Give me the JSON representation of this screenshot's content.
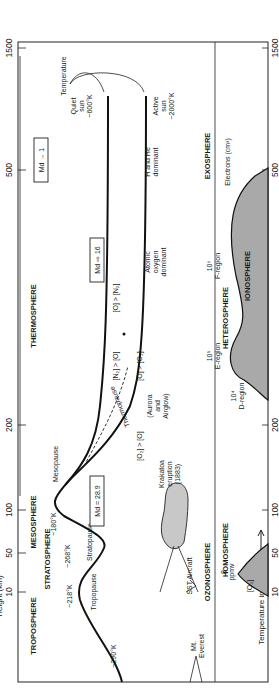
{
  "diagram": {
    "type": "atmospheric-structure",
    "orientation": "rotated-90-ccw",
    "y_axis": {
      "label": "Height (km)",
      "ticks": [
        "1500",
        "500",
        "200",
        "100",
        "50",
        "10"
      ]
    },
    "x_axis": {
      "label": "Temperature increase",
      "arrow": "→"
    },
    "thermal_layers": [
      {
        "name": "THERMOSPHERE"
      },
      {
        "name": "MESOSPHERE"
      },
      {
        "name": "STRATOSPHERE"
      },
      {
        "name": "TROPOSPHERE"
      }
    ],
    "temperature_labels": {
      "temperature": "Temperature",
      "quiet_sun": [
        "Quiet",
        "sun",
        "~600°K"
      ],
      "active_sun": [
        "Active",
        "sun",
        "~2000°K"
      ],
      "thermopause": "Thermopause",
      "mesopause": "Mesopause",
      "mesopause_temp": "~180°K",
      "stratopause": "Stratopause",
      "stratopause_temp": "~268°K",
      "tropopause": "Tropopause",
      "tropopause_temp": "~218°K",
      "surface_temp": "~290°K"
    },
    "composition": {
      "h_he": [
        "H and He",
        "dominant"
      ],
      "atomic_oxygen": [
        "Atomic",
        "oxygen",
        "dominant"
      ],
      "o_gt_o2": "[O] > [O₂]",
      "o2_gt_o": "[O₂] > [O]",
      "aurora": [
        "(Aurora",
        "and",
        "Airglow)"
      ],
      "o_gt_n2": "[O] > [N₂]",
      "n2_gt_o": "[N₂] > [O]"
    },
    "molecular_weight": {
      "md_1": "Md → 1",
      "md_16": "Md ⇨ 16",
      "md_28": "Md = 28.9"
    },
    "spheres": {
      "exosphere": "EXOSPHERE",
      "heterosphere": "HETEROSPHERE",
      "homosphere": "HOMOSPHERE",
      "ionosphere": "IONOSPHERE",
      "ozonosphere": "OZONOSPHERE"
    },
    "ionosphere_regions": {
      "electrons": "Electrons (cm³)",
      "f_region": [
        "10⁶",
        "F-region"
      ],
      "e_region": [
        "10⁵",
        "E-region"
      ],
      "d_region": [
        "10⁴",
        "D-region"
      ]
    },
    "ozone": {
      "value": [
        "8",
        "ppmv"
      ],
      "species": "[O₃]"
    },
    "landmarks": {
      "krakatoa": [
        "Krakatoa",
        "eruption",
        "(1883)"
      ],
      "sst": "SST Aircraft",
      "everest": [
        "Mt.",
        "Everest"
      ]
    },
    "colors": {
      "shade": "#a9a9a9",
      "ink": "#1a1a1a",
      "background": "#ffffff"
    }
  }
}
